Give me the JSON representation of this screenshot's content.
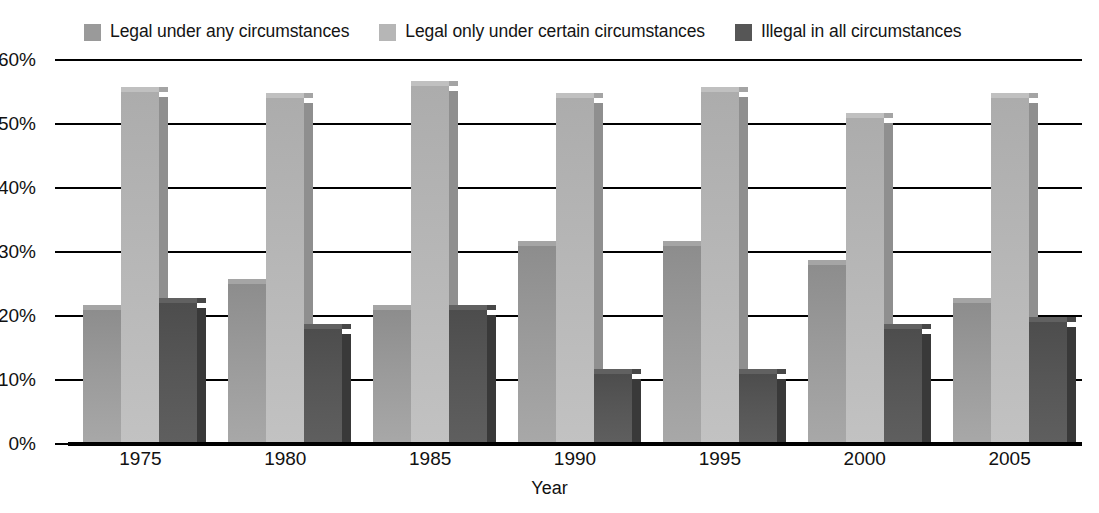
{
  "chart_data": {
    "type": "bar",
    "title": "",
    "subtitle": "",
    "xlabel": "Year",
    "ylabel": "",
    "categories": [
      "1975",
      "1980",
      "1985",
      "1990",
      "1995",
      "2000",
      "2005"
    ],
    "series": [
      {
        "name": "Legal under any circumstances",
        "color": "#9a9a9a",
        "values": [
          21,
          25,
          21,
          31,
          31,
          28,
          22
        ]
      },
      {
        "name": "Legal only under certain circumstances",
        "color": "#b6b6b6",
        "values": [
          55,
          54,
          56,
          54,
          55,
          51,
          54
        ]
      },
      {
        "name": "Illegal in all circumstances",
        "color": "#565656",
        "values": [
          22,
          18,
          21,
          11,
          11,
          18,
          19
        ]
      }
    ],
    "ylim": [
      0,
      60
    ],
    "ytick_labels": [
      "60%",
      "50%",
      "40%",
      "30%",
      "20%",
      "10%",
      "0%"
    ],
    "ytick_values": [
      60,
      50,
      40,
      30,
      20,
      10,
      0
    ],
    "grid": true,
    "grid_axis": "y",
    "legend_position": "top",
    "value_suffix": "%",
    "style": "3d-column"
  },
  "legend": {
    "items": [
      {
        "label": "Legal under any circumstances",
        "swatch": "#9a9a9a"
      },
      {
        "label": "Legal only under certain circumstances",
        "swatch": "#b6b6b6"
      },
      {
        "label": "Illegal in all circumstances",
        "swatch": "#565656"
      }
    ]
  },
  "axes": {
    "x": {
      "label": "Year",
      "ticks": [
        "1975",
        "1980",
        "1985",
        "1990",
        "1995",
        "2000",
        "2005"
      ]
    },
    "y": {
      "label": "",
      "ticks": [
        "60%",
        "50%",
        "40%",
        "30%",
        "20%",
        "10%",
        "0%"
      ]
    }
  }
}
